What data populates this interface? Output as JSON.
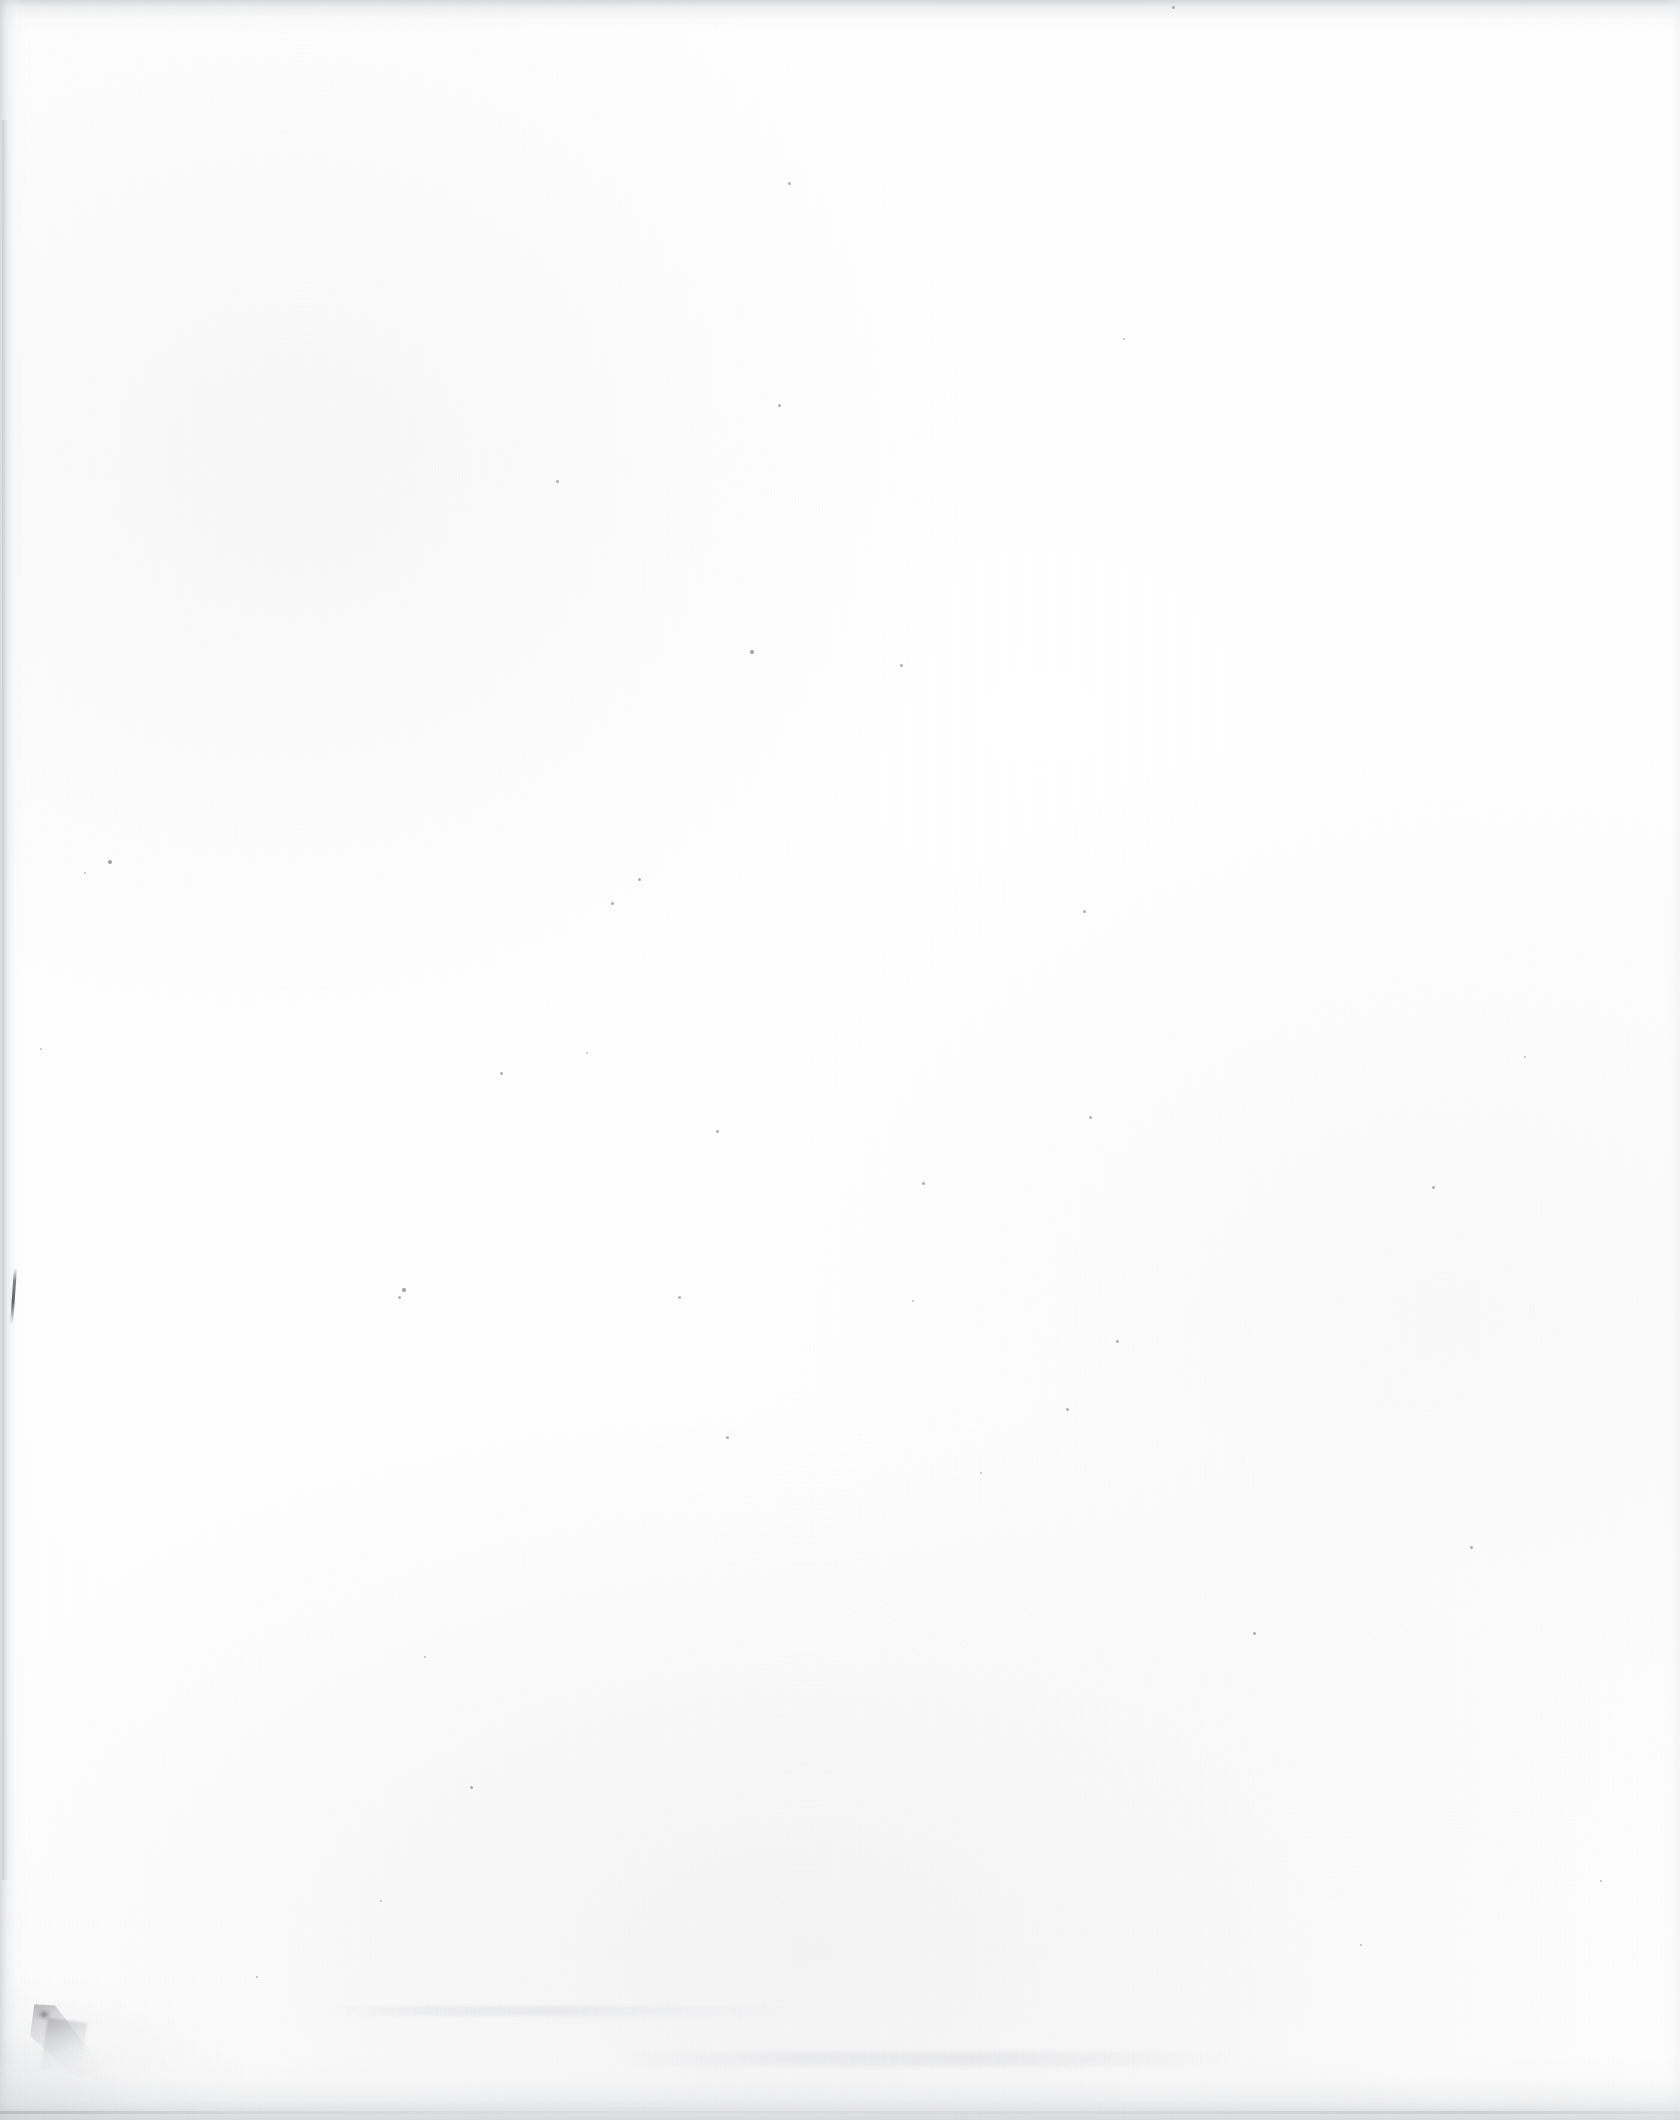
{
  "document": {
    "kind": "scanned-page",
    "page_content": "",
    "page_state_label": "Blank page",
    "text_blocks": [],
    "headings": [],
    "page_number": "",
    "annotations": []
  },
  "canvas": {
    "width": 1680,
    "height": 2120,
    "paper_color": "#fefefe",
    "background_color": "#ffffff"
  },
  "artifacts": {
    "edge_shadow_color": "#cdced0",
    "smudge_color": "#78787c",
    "ink_stroke_color": "#4e4e52",
    "speck_color": "#6e6e74",
    "items": [
      {
        "name": "top-edge-shadow",
        "x": 0,
        "y": 0,
        "w": 1680,
        "h": 34
      },
      {
        "name": "left-edge-shadow",
        "x": 0,
        "y": 0,
        "w": 26,
        "h": 2120
      },
      {
        "name": "bottom-edge-shadow",
        "x": 0,
        "y": 2054,
        "w": 1680,
        "h": 66
      },
      {
        "name": "right-edge-shadow",
        "x": 1664,
        "y": 0,
        "w": 16,
        "h": 2120
      },
      {
        "name": "bottom-left-smudge",
        "x": 30,
        "y": 2004,
        "w": 74,
        "h": 76
      },
      {
        "name": "left-edge-ink-stroke",
        "x": 12,
        "y": 1268,
        "w": 3,
        "h": 56
      }
    ],
    "specks": [
      {
        "x": 750,
        "y": 650,
        "d": 4
      },
      {
        "x": 788,
        "y": 182,
        "d": 3
      },
      {
        "x": 1172,
        "y": 6,
        "d": 3
      },
      {
        "x": 556,
        "y": 480,
        "d": 3
      },
      {
        "x": 778,
        "y": 404,
        "d": 3
      },
      {
        "x": 1123,
        "y": 338,
        "d": 2
      },
      {
        "x": 900,
        "y": 664,
        "d": 3
      },
      {
        "x": 108,
        "y": 860,
        "d": 4
      },
      {
        "x": 84,
        "y": 872,
        "d": 2
      },
      {
        "x": 638,
        "y": 878,
        "d": 3
      },
      {
        "x": 611,
        "y": 902,
        "d": 3
      },
      {
        "x": 1083,
        "y": 910,
        "d": 3
      },
      {
        "x": 1432,
        "y": 1186,
        "d": 3
      },
      {
        "x": 1089,
        "y": 1116,
        "d": 3
      },
      {
        "x": 500,
        "y": 1072,
        "d": 3
      },
      {
        "x": 586,
        "y": 1052,
        "d": 2
      },
      {
        "x": 922,
        "y": 1182,
        "d": 3
      },
      {
        "x": 716,
        "y": 1130,
        "d": 3
      },
      {
        "x": 402,
        "y": 1288,
        "d": 4
      },
      {
        "x": 398,
        "y": 1296,
        "d": 3
      },
      {
        "x": 678,
        "y": 1296,
        "d": 3
      },
      {
        "x": 912,
        "y": 1300,
        "d": 2
      },
      {
        "x": 1116,
        "y": 1340,
        "d": 3
      },
      {
        "x": 1066,
        "y": 1408,
        "d": 3
      },
      {
        "x": 726,
        "y": 1436,
        "d": 3
      },
      {
        "x": 1253,
        "y": 1632,
        "d": 3
      },
      {
        "x": 1470,
        "y": 1546,
        "d": 3
      },
      {
        "x": 980,
        "y": 1472,
        "d": 2
      },
      {
        "x": 424,
        "y": 1656,
        "d": 2
      },
      {
        "x": 470,
        "y": 1786,
        "d": 3
      },
      {
        "x": 380,
        "y": 1900,
        "d": 2
      },
      {
        "x": 1600,
        "y": 1880,
        "d": 2
      },
      {
        "x": 256,
        "y": 1976,
        "d": 2
      },
      {
        "x": 1524,
        "y": 1056,
        "d": 2
      },
      {
        "x": 40,
        "y": 1048,
        "d": 2
      },
      {
        "x": 1360,
        "y": 1944,
        "d": 2
      }
    ]
  }
}
